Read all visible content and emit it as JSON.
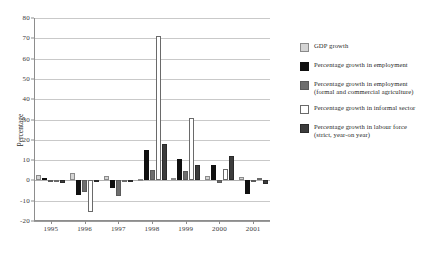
{
  "chart_data": {
    "type": "bar",
    "title": "",
    "subtitle": "",
    "xlabel": "",
    "ylabel": "Percentage",
    "ylim": [
      -20,
      80
    ],
    "ytick_step": 10,
    "yticks": [
      80,
      70,
      60,
      50,
      40,
      30,
      20,
      10,
      0,
      -10,
      -20
    ],
    "ytick_labels": [
      "80",
      "70",
      "60",
      "50",
      "40",
      "30",
      "20",
      "10",
      "0",
      "-10",
      "-20"
    ],
    "categories": [
      "1995",
      "1996",
      "1997",
      "1998",
      "1999",
      "2000",
      "2001"
    ],
    "grid": "horizontal",
    "legend_position": "right",
    "series": [
      {
        "name": "GDP growth",
        "color": "#d4d4d4",
        "border": "#8a8a8a",
        "values": [
          2.6,
          3.8,
          2.4,
          0.8,
          1.4,
          2.0,
          1.7
        ]
      },
      {
        "name": "Percentage growth in employment",
        "color": "#101010",
        "border": "#101010",
        "values": [
          1.1,
          -7.0,
          -3.6,
          15.0,
          10.6,
          7.5,
          -6.5
        ]
      },
      {
        "name": "Percentage growth in employment (formal and commercial agriculture)",
        "color": "#6e6e6e",
        "border": "#5a5a5a",
        "values": [
          -0.4,
          -5.7,
          -7.6,
          5.2,
          4.6,
          -1.5,
          0.4
        ]
      },
      {
        "name": "Percentage growth in informal sector",
        "color": "#ffffff",
        "border": "#6a6a6a",
        "values": [
          0.0,
          -15.4,
          -0.7,
          70.9,
          30.7,
          5.8,
          1.0
        ]
      },
      {
        "name": "Percentage growth in labour force (strict, year-on year)",
        "color": "#3c3c3c",
        "border": "#2a2a2a",
        "values": [
          -1.5,
          -0.6,
          -0.5,
          18.1,
          7.6,
          12.0,
          -2.0
        ]
      }
    ]
  },
  "legend": {
    "items": [
      {
        "label": "GDP growth",
        "sub": ""
      },
      {
        "label": "Percentage growth in employment",
        "sub": ""
      },
      {
        "label": "Percentage growth in employment",
        "sub": "(formal and commercial agriculture)"
      },
      {
        "label": "Percentage growth in informal sector",
        "sub": ""
      },
      {
        "label": "Percentage growth in labour force",
        "sub": "(strict,  year-on year)"
      }
    ]
  },
  "axis": {
    "y_title": "Percentage"
  }
}
